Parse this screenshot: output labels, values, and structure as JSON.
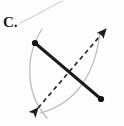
{
  "figure": {
    "label": "C.",
    "caption_label_name": "figure-letter-label",
    "background_color": "#fdfdfd",
    "width": 124,
    "height": 126
  },
  "colors": {
    "segment_stroke": "#1c1c1c",
    "dashed_stroke": "#2a2a2a",
    "arc_stroke": "#b9b9b9",
    "leader_stroke": "#c9c9c9",
    "endpoint_fill": "#121212",
    "label_color": "#1a1a1a"
  },
  "elements": {
    "leader_line": {
      "name": "label-leader-line",
      "from": [
        20,
        23
      ],
      "to": [
        62,
        1
      ],
      "stroke_width": 1
    },
    "main_segment": {
      "name": "main-segment",
      "from": [
        35,
        43
      ],
      "to": [
        101,
        99
      ],
      "stroke_width": 3,
      "endpoint_radius": 3.1,
      "endpoints": [
        {
          "name": "segment-endpoint-upper-left",
          "cx": 35,
          "cy": 43
        },
        {
          "name": "segment-endpoint-lower-right",
          "cx": 101,
          "cy": 99
        }
      ]
    },
    "dashed_bisector": {
      "name": "dashed-bisector-line",
      "from": [
        38,
        108
      ],
      "to": [
        106,
        29
      ],
      "stroke_width": 1.7,
      "dash_pattern": "4.5 3.5",
      "arrowheads": [
        "start",
        "end"
      ]
    },
    "arc_left": {
      "name": "construction-arc-left",
      "path": "M 46 116 C 24 92 24 56 43 31",
      "stroke_width": 1.2
    },
    "arc_right": {
      "name": "construction-arc-right",
      "path": "M 43 113 C 78 102 97 72 99 33",
      "stroke_width": 1.2
    },
    "arc_intersections": [
      {
        "name": "arc-intersection-upper-right",
        "x": 96,
        "y": 41
      },
      {
        "name": "arc-intersection-lower-left",
        "x": 44,
        "y": 103
      }
    ]
  },
  "chart_data": {
    "type": "diagram",
    "title": "C.",
    "items": [
      {
        "kind": "segment",
        "label": "main segment",
        "style": "solid thick",
        "endpoints_marked": true
      },
      {
        "kind": "arc",
        "label": "compass arc from left endpoint",
        "style": "thin gray"
      },
      {
        "kind": "arc",
        "label": "compass arc from right endpoint",
        "style": "thin gray"
      },
      {
        "kind": "line",
        "label": "perpendicular bisector",
        "style": "dashed double-arrow"
      }
    ]
  }
}
